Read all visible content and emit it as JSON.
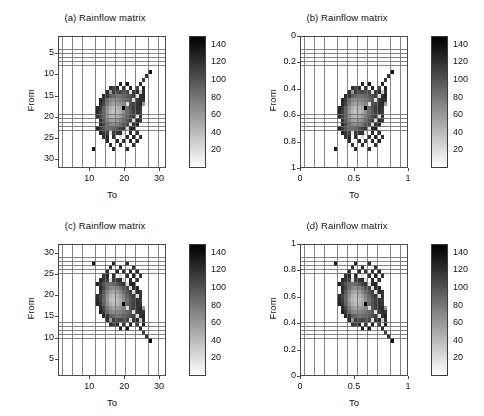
{
  "figure": {
    "background": "#ffffff",
    "panel_count": 4,
    "width": 484,
    "height": 416
  },
  "panels": [
    {
      "key": "a",
      "title": "(a) Rainflow matrix",
      "xlabel": "To",
      "ylabel": "From",
      "xticks": [
        "10",
        "20",
        "30"
      ],
      "xtick_values": [
        10,
        20,
        30
      ],
      "yticks": [
        "5",
        "10",
        "15",
        "20",
        "25",
        "30"
      ],
      "ytick_values": [
        5,
        10,
        15,
        20,
        25,
        30
      ],
      "xlim": [
        1,
        32
      ],
      "ylim": [
        1,
        32
      ],
      "y_reversed": true,
      "colorbar_ticks": [
        "20",
        "40",
        "60",
        "80",
        "100",
        "120",
        "140"
      ],
      "colorbar_tick_values": [
        20,
        40,
        60,
        80,
        100,
        120,
        140
      ],
      "colorbar_range": [
        0,
        150
      ]
    },
    {
      "key": "b",
      "title": "(b) Rainflow matrix",
      "xlabel": "To",
      "ylabel": "From",
      "xticks": [
        "0",
        "0.5",
        "1"
      ],
      "xtick_values": [
        0,
        0.5,
        1
      ],
      "yticks": [
        "0",
        "0.2",
        "0.4",
        "0.6",
        "0.8",
        "1"
      ],
      "ytick_values": [
        0,
        0.2,
        0.4,
        0.6,
        0.8,
        1
      ],
      "xlim": [
        0,
        1
      ],
      "ylim": [
        0,
        1
      ],
      "y_reversed": true,
      "colorbar_ticks": [
        "20",
        "40",
        "60",
        "80",
        "100",
        "120",
        "140"
      ],
      "colorbar_tick_values": [
        20,
        40,
        60,
        80,
        100,
        120,
        140
      ],
      "colorbar_range": [
        0,
        150
      ]
    },
    {
      "key": "c",
      "title": "(c) Rainflow matrix",
      "xlabel": "To",
      "ylabel": "From",
      "xticks": [
        "10",
        "20",
        "30"
      ],
      "xtick_values": [
        10,
        20,
        30
      ],
      "yticks": [
        "5",
        "10",
        "15",
        "20",
        "25",
        "30"
      ],
      "ytick_values": [
        5,
        10,
        15,
        20,
        25,
        30
      ],
      "xlim": [
        1,
        32
      ],
      "ylim": [
        1,
        32
      ],
      "y_reversed": false,
      "colorbar_ticks": [
        "20",
        "40",
        "60",
        "80",
        "100",
        "120",
        "140"
      ],
      "colorbar_tick_values": [
        20,
        40,
        60,
        80,
        100,
        120,
        140
      ],
      "colorbar_range": [
        0,
        150
      ]
    },
    {
      "key": "d",
      "title": "(d) Rainflow matrix",
      "xlabel": "To",
      "ylabel": "From",
      "xticks": [
        "0",
        "0.5",
        "1"
      ],
      "xtick_values": [
        0,
        0.5,
        1
      ],
      "yticks": [
        "0",
        "0.2",
        "0.4",
        "0.6",
        "0.8",
        "1"
      ],
      "ytick_values": [
        0,
        0.2,
        0.4,
        0.6,
        0.8,
        1
      ],
      "xlim": [
        0,
        1
      ],
      "ylim": [
        0,
        1
      ],
      "y_reversed": false,
      "colorbar_ticks": [
        "20",
        "40",
        "60",
        "80",
        "100",
        "120",
        "140"
      ],
      "colorbar_tick_values": [
        20,
        40,
        60,
        80,
        100,
        120,
        140
      ],
      "colorbar_range": [
        0,
        150
      ]
    }
  ],
  "chart_data": {
    "type": "heatmap",
    "title": "(a) Rainflow matrix",
    "xlabel": "To",
    "ylabel": "From",
    "colormap": "gray-reversed",
    "grid": true,
    "legend_position": "right-colorbar",
    "nrows": 32,
    "ncols": 32,
    "vmin": 0,
    "vmax": 150,
    "colorbar_ticks": [
      20,
      40,
      60,
      80,
      100,
      120,
      140
    ],
    "x": [
      1,
      2,
      3,
      4,
      5,
      6,
      7,
      8,
      9,
      10,
      11,
      12,
      13,
      14,
      15,
      16,
      17,
      18,
      19,
      20,
      21,
      22,
      23,
      24,
      25,
      26,
      27,
      28,
      29,
      30,
      31,
      32
    ],
    "y": [
      1,
      2,
      3,
      4,
      5,
      6,
      7,
      8,
      9,
      10,
      11,
      12,
      13,
      14,
      15,
      16,
      17,
      18,
      19,
      20,
      21,
      22,
      23,
      24,
      25,
      26,
      27,
      28,
      29,
      30,
      31,
      32
    ],
    "note": "Values are counts in each (From,To) cell; 0 renders white. Dense core near From 15-25, To 14-26 with bright (low-count) center near (20,18) and a dark anti-diagonal ridge.",
    "cells": [
      {
        "row": 9,
        "col": 28,
        "value": 140
      },
      {
        "row": 10,
        "col": 27,
        "value": 120
      },
      {
        "row": 11,
        "col": 26,
        "value": 115
      },
      {
        "row": 12,
        "col": 25,
        "value": 125
      },
      {
        "row": 12,
        "col": 19,
        "value": 130
      },
      {
        "row": 12,
        "col": 21,
        "value": 135
      },
      {
        "row": 13,
        "col": 16,
        "value": 120
      },
      {
        "row": 13,
        "col": 17,
        "value": 110
      },
      {
        "row": 13,
        "col": 18,
        "value": 125
      },
      {
        "row": 13,
        "col": 20,
        "value": 118
      },
      {
        "row": 13,
        "col": 22,
        "value": 128
      },
      {
        "row": 13,
        "col": 24,
        "value": 112
      },
      {
        "row": 13,
        "col": 26,
        "value": 130
      },
      {
        "row": 14,
        "col": 15,
        "value": 122
      },
      {
        "row": 14,
        "col": 16,
        "value": 60
      },
      {
        "row": 14,
        "col": 17,
        "value": 115
      },
      {
        "row": 14,
        "col": 18,
        "value": 105
      },
      {
        "row": 14,
        "col": 19,
        "value": 108
      },
      {
        "row": 14,
        "col": 20,
        "value": 100
      },
      {
        "row": 14,
        "col": 21,
        "value": 110
      },
      {
        "row": 14,
        "col": 22,
        "value": 20
      },
      {
        "row": 14,
        "col": 23,
        "value": 118
      },
      {
        "row": 14,
        "col": 24,
        "value": 126
      },
      {
        "row": 14,
        "col": 25,
        "value": 30
      },
      {
        "row": 14,
        "col": 26,
        "value": 120
      },
      {
        "row": 15,
        "col": 14,
        "value": 125
      },
      {
        "row": 15,
        "col": 15,
        "value": 118
      },
      {
        "row": 15,
        "col": 16,
        "value": 95
      },
      {
        "row": 15,
        "col": 17,
        "value": 88
      },
      {
        "row": 15,
        "col": 18,
        "value": 82
      },
      {
        "row": 15,
        "col": 19,
        "value": 85
      },
      {
        "row": 15,
        "col": 20,
        "value": 90
      },
      {
        "row": 15,
        "col": 21,
        "value": 96
      },
      {
        "row": 15,
        "col": 22,
        "value": 104
      },
      {
        "row": 15,
        "col": 23,
        "value": 112
      },
      {
        "row": 15,
        "col": 24,
        "value": 20
      },
      {
        "row": 15,
        "col": 25,
        "value": 122
      },
      {
        "row": 15,
        "col": 26,
        "value": 128
      },
      {
        "row": 16,
        "col": 13,
        "value": 130
      },
      {
        "row": 16,
        "col": 14,
        "value": 116
      },
      {
        "row": 16,
        "col": 15,
        "value": 86
      },
      {
        "row": 16,
        "col": 16,
        "value": 72
      },
      {
        "row": 16,
        "col": 17,
        "value": 68
      },
      {
        "row": 16,
        "col": 18,
        "value": 70
      },
      {
        "row": 16,
        "col": 19,
        "value": 75
      },
      {
        "row": 16,
        "col": 20,
        "value": 80
      },
      {
        "row": 16,
        "col": 21,
        "value": 88
      },
      {
        "row": 16,
        "col": 22,
        "value": 98
      },
      {
        "row": 16,
        "col": 23,
        "value": 20
      },
      {
        "row": 16,
        "col": 24,
        "value": 115
      },
      {
        "row": 16,
        "col": 25,
        "value": 124
      },
      {
        "row": 16,
        "col": 26,
        "value": 118
      },
      {
        "row": 17,
        "col": 13,
        "value": 124
      },
      {
        "row": 17,
        "col": 14,
        "value": 108
      },
      {
        "row": 17,
        "col": 15,
        "value": 78
      },
      {
        "row": 17,
        "col": 16,
        "value": 62
      },
      {
        "row": 17,
        "col": 17,
        "value": 55
      },
      {
        "row": 17,
        "col": 18,
        "value": 58
      },
      {
        "row": 17,
        "col": 19,
        "value": 64
      },
      {
        "row": 17,
        "col": 20,
        "value": 72
      },
      {
        "row": 17,
        "col": 21,
        "value": 20
      },
      {
        "row": 17,
        "col": 22,
        "value": 100
      },
      {
        "row": 17,
        "col": 23,
        "value": 110
      },
      {
        "row": 17,
        "col": 24,
        "value": 120
      },
      {
        "row": 17,
        "col": 25,
        "value": 126
      },
      {
        "row": 17,
        "col": 26,
        "value": 60
      },
      {
        "row": 18,
        "col": 12,
        "value": 128
      },
      {
        "row": 18,
        "col": 13,
        "value": 118
      },
      {
        "row": 18,
        "col": 14,
        "value": 92
      },
      {
        "row": 18,
        "col": 15,
        "value": 66
      },
      {
        "row": 18,
        "col": 16,
        "value": 48
      },
      {
        "row": 18,
        "col": 17,
        "value": 40
      },
      {
        "row": 18,
        "col": 18,
        "value": 44
      },
      {
        "row": 18,
        "col": 19,
        "value": 52
      },
      {
        "row": 18,
        "col": 20,
        "value": 148
      },
      {
        "row": 18,
        "col": 21,
        "value": 86
      },
      {
        "row": 18,
        "col": 22,
        "value": 102
      },
      {
        "row": 18,
        "col": 23,
        "value": 114
      },
      {
        "row": 18,
        "col": 24,
        "value": 122
      },
      {
        "row": 18,
        "col": 25,
        "value": 118
      },
      {
        "row": 19,
        "col": 12,
        "value": 126
      },
      {
        "row": 19,
        "col": 13,
        "value": 112
      },
      {
        "row": 19,
        "col": 14,
        "value": 88
      },
      {
        "row": 19,
        "col": 15,
        "value": 60
      },
      {
        "row": 19,
        "col": 16,
        "value": 42
      },
      {
        "row": 19,
        "col": 17,
        "value": 35
      },
      {
        "row": 19,
        "col": 18,
        "value": 38
      },
      {
        "row": 19,
        "col": 19,
        "value": 50
      },
      {
        "row": 19,
        "col": 20,
        "value": 66
      },
      {
        "row": 19,
        "col": 21,
        "value": 84
      },
      {
        "row": 19,
        "col": 22,
        "value": 100
      },
      {
        "row": 19,
        "col": 23,
        "value": 112
      },
      {
        "row": 19,
        "col": 24,
        "value": 120
      },
      {
        "row": 19,
        "col": 25,
        "value": 115
      },
      {
        "row": 20,
        "col": 12,
        "value": 122
      },
      {
        "row": 20,
        "col": 13,
        "value": 110
      },
      {
        "row": 20,
        "col": 14,
        "value": 90
      },
      {
        "row": 20,
        "col": 15,
        "value": 64
      },
      {
        "row": 20,
        "col": 16,
        "value": 46
      },
      {
        "row": 20,
        "col": 17,
        "value": 40
      },
      {
        "row": 20,
        "col": 18,
        "value": 46
      },
      {
        "row": 20,
        "col": 19,
        "value": 58
      },
      {
        "row": 20,
        "col": 20,
        "value": 74
      },
      {
        "row": 20,
        "col": 21,
        "value": 90
      },
      {
        "row": 20,
        "col": 22,
        "value": 104
      },
      {
        "row": 20,
        "col": 23,
        "value": 116
      },
      {
        "row": 20,
        "col": 24,
        "value": 20
      },
      {
        "row": 20,
        "col": 25,
        "value": 120
      },
      {
        "row": 21,
        "col": 13,
        "value": 120
      },
      {
        "row": 21,
        "col": 14,
        "value": 96
      },
      {
        "row": 21,
        "col": 15,
        "value": 72
      },
      {
        "row": 21,
        "col": 16,
        "value": 56
      },
      {
        "row": 21,
        "col": 17,
        "value": 52
      },
      {
        "row": 21,
        "col": 18,
        "value": 58
      },
      {
        "row": 21,
        "col": 19,
        "value": 70
      },
      {
        "row": 21,
        "col": 20,
        "value": 86
      },
      {
        "row": 21,
        "col": 21,
        "value": 100
      },
      {
        "row": 21,
        "col": 22,
        "value": 114
      },
      {
        "row": 21,
        "col": 23,
        "value": 20
      },
      {
        "row": 21,
        "col": 24,
        "value": 124
      },
      {
        "row": 21,
        "col": 25,
        "value": 118
      },
      {
        "row": 22,
        "col": 13,
        "value": 126
      },
      {
        "row": 22,
        "col": 14,
        "value": 108
      },
      {
        "row": 22,
        "col": 15,
        "value": 84
      },
      {
        "row": 22,
        "col": 16,
        "value": 70
      },
      {
        "row": 22,
        "col": 17,
        "value": 66
      },
      {
        "row": 22,
        "col": 18,
        "value": 72
      },
      {
        "row": 22,
        "col": 19,
        "value": 84
      },
      {
        "row": 22,
        "col": 20,
        "value": 98
      },
      {
        "row": 22,
        "col": 21,
        "value": 110
      },
      {
        "row": 22,
        "col": 22,
        "value": 20
      },
      {
        "row": 22,
        "col": 23,
        "value": 122
      },
      {
        "row": 22,
        "col": 24,
        "value": 128
      },
      {
        "row": 23,
        "col": 12,
        "value": 130
      },
      {
        "row": 23,
        "col": 13,
        "value": 116
      },
      {
        "row": 23,
        "col": 14,
        "value": 100
      },
      {
        "row": 23,
        "col": 15,
        "value": 88
      },
      {
        "row": 23,
        "col": 16,
        "value": 84
      },
      {
        "row": 23,
        "col": 17,
        "value": 90
      },
      {
        "row": 23,
        "col": 18,
        "value": 100
      },
      {
        "row": 23,
        "col": 19,
        "value": 110
      },
      {
        "row": 23,
        "col": 20,
        "value": 118
      },
      {
        "row": 23,
        "col": 21,
        "value": 20
      },
      {
        "row": 23,
        "col": 22,
        "value": 126
      },
      {
        "row": 23,
        "col": 23,
        "value": 130
      },
      {
        "row": 24,
        "col": 13,
        "value": 128
      },
      {
        "row": 24,
        "col": 14,
        "value": 118
      },
      {
        "row": 24,
        "col": 15,
        "value": 112
      },
      {
        "row": 24,
        "col": 16,
        "value": 20
      },
      {
        "row": 24,
        "col": 17,
        "value": 114
      },
      {
        "row": 24,
        "col": 18,
        "value": 118
      },
      {
        "row": 24,
        "col": 19,
        "value": 122
      },
      {
        "row": 24,
        "col": 20,
        "value": 20
      },
      {
        "row": 24,
        "col": 22,
        "value": 126
      },
      {
        "row": 24,
        "col": 24,
        "value": 120
      },
      {
        "row": 25,
        "col": 14,
        "value": 120
      },
      {
        "row": 25,
        "col": 15,
        "value": 126
      },
      {
        "row": 25,
        "col": 17,
        "value": 124
      },
      {
        "row": 25,
        "col": 19,
        "value": 20
      },
      {
        "row": 25,
        "col": 21,
        "value": 122
      },
      {
        "row": 25,
        "col": 23,
        "value": 128
      },
      {
        "row": 25,
        "col": 25,
        "value": 118
      },
      {
        "row": 26,
        "col": 15,
        "value": 124
      },
      {
        "row": 26,
        "col": 18,
        "value": 126
      },
      {
        "row": 26,
        "col": 20,
        "value": 120
      },
      {
        "row": 26,
        "col": 22,
        "value": 124
      },
      {
        "row": 26,
        "col": 24,
        "value": 126
      },
      {
        "row": 27,
        "col": 16,
        "value": 122
      },
      {
        "row": 27,
        "col": 19,
        "value": 124
      },
      {
        "row": 27,
        "col": 23,
        "value": 120
      },
      {
        "row": 28,
        "col": 11,
        "value": 135
      },
      {
        "row": 28,
        "col": 17,
        "value": 126
      },
      {
        "row": 28,
        "col": 21,
        "value": 122
      }
    ]
  }
}
